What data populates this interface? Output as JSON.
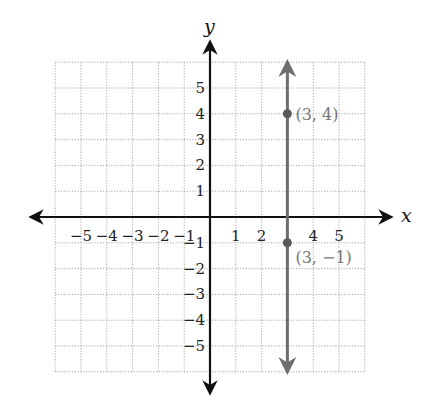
{
  "chart_data": {
    "type": "line",
    "title": "",
    "xlabel": "x",
    "ylabel": "y",
    "xlim": [
      -6,
      6
    ],
    "ylim": [
      -6,
      6
    ],
    "grid": true,
    "x_ticks": [
      "-5",
      "-4",
      "-3",
      "-2",
      "-1",
      "1",
      "2",
      "4",
      "5"
    ],
    "y_ticks": [
      "5",
      "4",
      "3",
      "2",
      "1",
      "-1",
      "-2",
      "-3",
      "-4",
      "-5"
    ],
    "series": [
      {
        "name": "x = 3",
        "kind": "vertical-line",
        "x": 3,
        "color": "#6e6e6e"
      }
    ],
    "points": [
      {
        "x": 3,
        "y": 4,
        "label": "(3, 4)"
      },
      {
        "x": 3,
        "y": -1,
        "label": "(3, −1)"
      }
    ]
  },
  "labels": {
    "x_axis": "x",
    "y_axis": "y",
    "x_ticks": [
      {
        "v": -5,
        "t": "−5"
      },
      {
        "v": -4,
        "t": "−4"
      },
      {
        "v": -3,
        "t": "−3"
      },
      {
        "v": -2,
        "t": "−2"
      },
      {
        "v": -1,
        "t": "−1"
      },
      {
        "v": 1,
        "t": "1"
      },
      {
        "v": 2,
        "t": "2"
      },
      {
        "v": 4,
        "t": "4"
      },
      {
        "v": 5,
        "t": "5"
      }
    ],
    "y_ticks": [
      {
        "v": 5,
        "t": "5"
      },
      {
        "v": 4,
        "t": "4"
      },
      {
        "v": 3,
        "t": "3"
      },
      {
        "v": 2,
        "t": "2"
      },
      {
        "v": 1,
        "t": "1"
      },
      {
        "v": -1,
        "t": "−1"
      },
      {
        "v": -2,
        "t": "−2"
      },
      {
        "v": -3,
        "t": "−3"
      },
      {
        "v": -4,
        "t": "−4"
      },
      {
        "v": -5,
        "t": "−5"
      }
    ],
    "point_labels": [
      "(3, 4)",
      "(3, −1)"
    ]
  },
  "colors": {
    "axis": "#111111",
    "grid": "#a8a8a8",
    "line": "#6e6e6e",
    "point_label": "#777777"
  }
}
